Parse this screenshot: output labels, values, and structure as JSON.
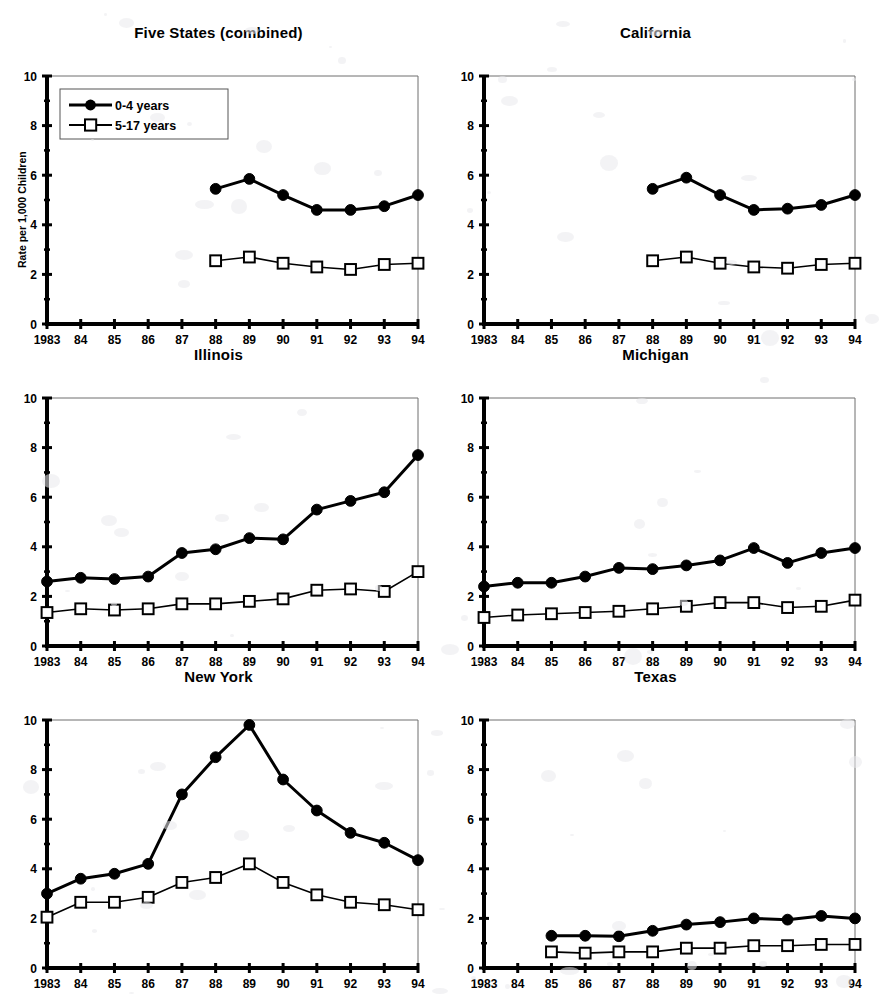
{
  "figure": {
    "ylabel": "Rate per 1,000 Children",
    "legend": {
      "series_0_label": "0-4 years",
      "series_1_label": "5-17 years"
    },
    "axis": {
      "y_ticks": [
        "0",
        "2",
        "4",
        "6",
        "8",
        "10"
      ],
      "x_ticks": [
        "1983",
        "84",
        "85",
        "86",
        "87",
        "88",
        "89",
        "90",
        "91",
        "92",
        "93",
        "94"
      ]
    },
    "panel_titles": {
      "five_states": "Five States (combined)",
      "california": "California",
      "illinois": "Illinois",
      "michigan": "Michigan",
      "new_york": "New York",
      "texas": "Texas"
    },
    "colors": {
      "ink": "#000000",
      "frame": "#6f6f6f",
      "background": "#ffffff"
    }
  },
  "chart_data": [
    {
      "type": "line",
      "title": "Five States (combined)",
      "xlabel": "",
      "ylabel": "Rate per 1,000 Children",
      "ylim": [
        0,
        10
      ],
      "xlim": [
        1983,
        1994
      ],
      "grid": false,
      "legend": "upper left",
      "x": [
        1983,
        1984,
        1985,
        1986,
        1987,
        1988,
        1989,
        1990,
        1991,
        1992,
        1993,
        1994
      ],
      "series": [
        {
          "name": "0-4 years",
          "marker": "filled-circle",
          "values": [
            null,
            null,
            null,
            null,
            null,
            5.45,
            5.85,
            5.2,
            4.6,
            4.6,
            4.75,
            5.2
          ]
        },
        {
          "name": "5-17 years",
          "marker": "open-square",
          "values": [
            null,
            null,
            null,
            null,
            null,
            2.55,
            2.7,
            2.45,
            2.3,
            2.2,
            2.4,
            2.45
          ]
        }
      ]
    },
    {
      "type": "line",
      "title": "California",
      "xlabel": "",
      "ylabel": "",
      "ylim": [
        0,
        10
      ],
      "xlim": [
        1983,
        1994
      ],
      "grid": false,
      "legend": "none",
      "x": [
        1983,
        1984,
        1985,
        1986,
        1987,
        1988,
        1989,
        1990,
        1991,
        1992,
        1993,
        1994
      ],
      "series": [
        {
          "name": "0-4 years",
          "marker": "filled-circle",
          "values": [
            null,
            null,
            null,
            null,
            null,
            5.45,
            5.9,
            5.2,
            4.6,
            4.65,
            4.8,
            5.2
          ]
        },
        {
          "name": "5-17 years",
          "marker": "open-square",
          "values": [
            null,
            null,
            null,
            null,
            null,
            2.55,
            2.7,
            2.45,
            2.3,
            2.25,
            2.4,
            2.45
          ]
        }
      ]
    },
    {
      "type": "line",
      "title": "Illinois",
      "xlabel": "",
      "ylabel": "",
      "ylim": [
        0,
        10
      ],
      "xlim": [
        1983,
        1994
      ],
      "grid": false,
      "legend": "none",
      "x": [
        1983,
        1984,
        1985,
        1986,
        1987,
        1988,
        1989,
        1990,
        1991,
        1992,
        1993,
        1994
      ],
      "series": [
        {
          "name": "0-4 years",
          "marker": "filled-circle",
          "values": [
            2.6,
            2.75,
            2.7,
            2.8,
            3.75,
            3.9,
            4.35,
            4.3,
            5.5,
            5.85,
            6.2,
            7.7
          ]
        },
        {
          "name": "5-17 years",
          "marker": "open-square",
          "values": [
            1.35,
            1.5,
            1.45,
            1.5,
            1.7,
            1.7,
            1.8,
            1.9,
            2.25,
            2.3,
            2.2,
            3.0
          ]
        }
      ]
    },
    {
      "type": "line",
      "title": "Michigan",
      "xlabel": "",
      "ylabel": "",
      "ylim": [
        0,
        10
      ],
      "xlim": [
        1983,
        1994
      ],
      "grid": false,
      "legend": "none",
      "x": [
        1983,
        1984,
        1985,
        1986,
        1987,
        1988,
        1989,
        1990,
        1991,
        1992,
        1993,
        1994
      ],
      "series": [
        {
          "name": "0-4 years",
          "marker": "filled-circle",
          "values": [
            2.4,
            2.55,
            2.55,
            2.8,
            3.15,
            3.1,
            3.25,
            3.45,
            3.95,
            3.35,
            3.75,
            3.95
          ]
        },
        {
          "name": "5-17 years",
          "marker": "open-square",
          "values": [
            1.15,
            1.25,
            1.3,
            1.35,
            1.4,
            1.5,
            1.6,
            1.75,
            1.75,
            1.55,
            1.6,
            1.85
          ]
        }
      ]
    },
    {
      "type": "line",
      "title": "New York",
      "xlabel": "",
      "ylabel": "",
      "ylim": [
        0,
        10
      ],
      "xlim": [
        1983,
        1994
      ],
      "grid": false,
      "legend": "none",
      "x": [
        1983,
        1984,
        1985,
        1986,
        1987,
        1988,
        1989,
        1990,
        1991,
        1992,
        1993,
        1994
      ],
      "series": [
        {
          "name": "0-4 years",
          "marker": "filled-circle",
          "values": [
            3.0,
            3.6,
            3.8,
            4.2,
            7.0,
            8.5,
            9.8,
            7.6,
            6.35,
            5.45,
            5.05,
            4.35
          ]
        },
        {
          "name": "5-17 years",
          "marker": "open-square",
          "values": [
            2.05,
            2.65,
            2.65,
            2.85,
            3.45,
            3.65,
            4.2,
            3.45,
            2.95,
            2.65,
            2.55,
            2.35
          ]
        }
      ]
    },
    {
      "type": "line",
      "title": "Texas",
      "xlabel": "",
      "ylabel": "",
      "ylim": [
        0,
        10
      ],
      "xlim": [
        1983,
        1994
      ],
      "grid": false,
      "legend": "none",
      "x": [
        1983,
        1984,
        1985,
        1986,
        1987,
        1988,
        1989,
        1990,
        1991,
        1992,
        1993,
        1994
      ],
      "series": [
        {
          "name": "0-4 years",
          "marker": "filled-circle",
          "values": [
            null,
            null,
            1.3,
            1.3,
            1.28,
            1.5,
            1.75,
            1.85,
            2.0,
            1.95,
            2.1,
            2.0
          ]
        },
        {
          "name": "5-17 years",
          "marker": "open-square",
          "values": [
            null,
            null,
            0.65,
            0.6,
            0.65,
            0.65,
            0.8,
            0.8,
            0.9,
            0.9,
            0.95,
            0.95
          ]
        }
      ]
    }
  ]
}
